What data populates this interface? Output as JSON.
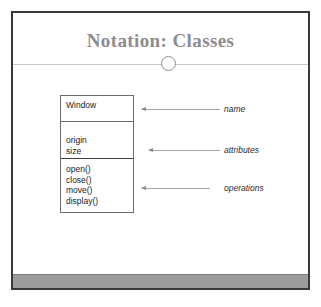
{
  "slide": {
    "title": "Notation: Classes",
    "title_color": "#8d8d8f",
    "frame_border_color": "#3a3a3c",
    "background_color": "#ffffff",
    "bottom_bar_color": "#9d9d9d"
  },
  "class_diagram": {
    "class_name": "Window",
    "attributes": [
      "origin",
      "size"
    ],
    "operations": [
      "open()",
      "close()",
      "move()",
      "display()"
    ],
    "box_border_color": "#6c6c70"
  },
  "annotations": [
    {
      "label": "name",
      "target": "class-name-compartment"
    },
    {
      "label": "attributes",
      "target": "attributes-compartment"
    },
    {
      "label": "operations",
      "target": "operations-compartment"
    }
  ]
}
